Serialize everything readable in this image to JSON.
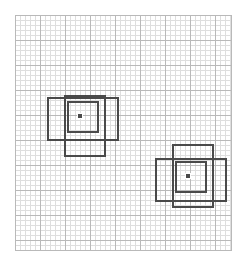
{
  "canvas": {
    "width": 248,
    "height": 266,
    "background": "#ffffff"
  },
  "grid": {
    "label": "graph-paper",
    "x": 15,
    "y": 15,
    "width": 217,
    "height": 236,
    "minor_cell_px": 5,
    "major_every": 5,
    "major_cell_px": 25,
    "minor_color": "#dedede",
    "major_color": "#b9b9b9",
    "border_color": "#b9b9b9",
    "background": "#ffffff"
  },
  "style": {
    "shape_stroke_color": "#4a4a4a",
    "shape_stroke_width": 2,
    "marker_fill": "#4a4a4a",
    "marker_border": "#ffffff"
  },
  "chart_data": {
    "type": "scatter",
    "title": "",
    "subtitle": "",
    "xlabel": "",
    "ylabel": "",
    "grid": true,
    "legend": "none",
    "xlim": [
      15,
      232
    ],
    "ylim": [
      15,
      251
    ],
    "tick_labels_x": [],
    "tick_labels_y": [],
    "annotations": [],
    "series": [
      {
        "name": "cluster-1",
        "center": {
          "x": 80,
          "y": 116
        },
        "marker": {
          "x": 77,
          "y": 113,
          "size": 6
        },
        "squares": [
          {
            "name": "tall-square",
            "x": 64,
            "y": 95,
            "width": 42,
            "height": 62
          },
          {
            "name": "wide-square",
            "x": 47,
            "y": 97,
            "width": 72,
            "height": 44
          },
          {
            "name": "inner-square",
            "x": 67,
            "y": 101,
            "width": 32,
            "height": 32
          }
        ]
      },
      {
        "name": "cluster-2",
        "center": {
          "x": 188,
          "y": 176
        },
        "marker": {
          "x": 185,
          "y": 173,
          "size": 6
        },
        "squares": [
          {
            "name": "tall-square",
            "x": 172,
            "y": 144,
            "width": 42,
            "height": 64
          },
          {
            "name": "wide-square",
            "x": 155,
            "y": 158,
            "width": 72,
            "height": 44
          },
          {
            "name": "inner-square",
            "x": 175,
            "y": 161,
            "width": 32,
            "height": 32
          }
        ]
      }
    ]
  }
}
